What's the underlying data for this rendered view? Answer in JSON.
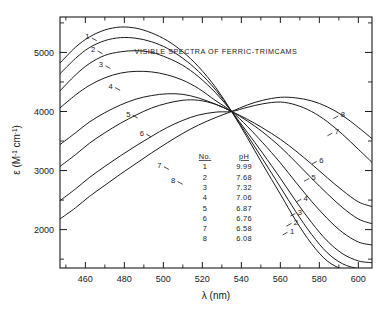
{
  "chart_data": {
    "type": "line",
    "title": "VISIBLE SPECTRA OF FERRIC-TRIMCAMS",
    "xlabel": "λ (nm)",
    "ylabel": "ε (M⁻¹ cm⁻¹)",
    "xlim": [
      447,
      607
    ],
    "ylim": [
      1350,
      5600
    ],
    "xticks": [
      460,
      480,
      500,
      520,
      540,
      560,
      580,
      600
    ],
    "yticks": [
      2000,
      3000,
      4000,
      5000
    ],
    "yminorticks": [
      1500,
      2500,
      3500,
      4500,
      5500
    ],
    "grid": false,
    "legend_position": "center",
    "isosbestic_point": {
      "x": 535,
      "y": 4000
    },
    "legend_headers": [
      "No.",
      "pH"
    ],
    "series": [
      {
        "name": "1",
        "pH": "9.99",
        "peak_x": 478,
        "peak_y": 5430,
        "x": [
          447,
          455,
          462,
          470,
          478,
          486,
          494,
          502,
          510,
          518,
          527,
          535,
          543,
          551,
          560,
          568,
          576,
          584,
          592,
          600,
          607
        ],
        "y": [
          4820,
          5090,
          5260,
          5380,
          5430,
          5410,
          5330,
          5200,
          5010,
          4760,
          4400,
          4000,
          3560,
          3100,
          2600,
          2150,
          1760,
          1470,
          1330,
          1300,
          1300
        ]
      },
      {
        "name": "2",
        "pH": "7.68",
        "peak_x": 480,
        "peak_y": 5250,
        "x": [
          447,
          455,
          462,
          470,
          478,
          486,
          494,
          502,
          510,
          518,
          527,
          535,
          543,
          551,
          560,
          568,
          576,
          584,
          592,
          600,
          607
        ],
        "y": [
          4640,
          4900,
          5080,
          5200,
          5250,
          5240,
          5180,
          5070,
          4900,
          4680,
          4360,
          4000,
          3600,
          3190,
          2720,
          2300,
          1920,
          1610,
          1420,
          1340,
          1330
        ]
      },
      {
        "name": "3",
        "pH": "7.32",
        "peak_x": 482,
        "peak_y": 5030,
        "x": [
          447,
          455,
          462,
          470,
          478,
          486,
          494,
          502,
          510,
          518,
          527,
          535,
          543,
          551,
          560,
          568,
          576,
          584,
          592,
          600,
          607
        ],
        "y": [
          4350,
          4620,
          4810,
          4950,
          5010,
          5030,
          5000,
          4910,
          4780,
          4590,
          4310,
          4000,
          3650,
          3290,
          2870,
          2480,
          2120,
          1810,
          1590,
          1470,
          1440
        ]
      },
      {
        "name": "4",
        "pH": "7.06",
        "peak_x": 484,
        "peak_y": 4680,
        "x": [
          447,
          455,
          462,
          470,
          478,
          486,
          494,
          502,
          510,
          518,
          527,
          535,
          543,
          551,
          560,
          568,
          576,
          584,
          592,
          600,
          607
        ],
        "y": [
          4060,
          4280,
          4440,
          4570,
          4650,
          4680,
          4670,
          4620,
          4530,
          4390,
          4180,
          4000,
          3750,
          3470,
          3130,
          2800,
          2480,
          2190,
          1950,
          1790,
          1740
        ]
      },
      {
        "name": "5",
        "pH": "6.87",
        "peak_x": 490,
        "peak_y": 4300,
        "x": [
          447,
          455,
          462,
          470,
          478,
          486,
          494,
          502,
          510,
          518,
          527,
          535,
          543,
          551,
          560,
          568,
          576,
          584,
          592,
          600,
          607
        ],
        "y": [
          3440,
          3640,
          3820,
          3980,
          4110,
          4210,
          4270,
          4300,
          4290,
          4230,
          4120,
          4000,
          3840,
          3650,
          3400,
          3140,
          2870,
          2610,
          2370,
          2180,
          2100
        ]
      },
      {
        "name": "6",
        "pH": "6.76",
        "peak_x": 498,
        "peak_y": 4190,
        "x": [
          447,
          455,
          462,
          470,
          478,
          486,
          494,
          502,
          510,
          518,
          527,
          535,
          543,
          551,
          560,
          568,
          576,
          584,
          592,
          600,
          607
        ],
        "y": [
          3070,
          3270,
          3460,
          3640,
          3800,
          3940,
          4060,
          4140,
          4190,
          4190,
          4120,
          4000,
          3870,
          3720,
          3530,
          3330,
          3110,
          2880,
          2660,
          2470,
          2390
        ]
      },
      {
        "name": "7",
        "pH": "6.58",
        "peak_x": 553,
        "peak_y": 4180,
        "x": [
          447,
          455,
          462,
          470,
          478,
          486,
          494,
          502,
          510,
          518,
          527,
          535,
          543,
          551,
          560,
          568,
          576,
          584,
          592,
          600,
          607
        ],
        "y": [
          2490,
          2690,
          2880,
          3070,
          3250,
          3420,
          3580,
          3730,
          3850,
          3940,
          3990,
          4000,
          4070,
          4130,
          4160,
          4110,
          4000,
          3830,
          3610,
          3360,
          3140
        ]
      },
      {
        "name": "8",
        "pH": "6.08",
        "peak_x": 560,
        "peak_y": 4240,
        "x": [
          447,
          455,
          462,
          470,
          478,
          486,
          494,
          502,
          510,
          518,
          527,
          535,
          543,
          551,
          560,
          568,
          576,
          584,
          592,
          600,
          607
        ],
        "y": [
          2180,
          2370,
          2560,
          2750,
          2940,
          3120,
          3300,
          3470,
          3630,
          3770,
          3900,
          4000,
          4110,
          4190,
          4240,
          4230,
          4180,
          4080,
          3930,
          3730,
          3540
        ]
      }
    ],
    "left_labels": [
      {
        "name": "1",
        "x": 461,
        "y": 5270
      },
      {
        "name": "2",
        "x": 464,
        "y": 5050
      },
      {
        "name": "3",
        "x": 468,
        "y": 4800
      },
      {
        "name": "4",
        "x": 473,
        "y": 4430
      },
      {
        "name": "5",
        "x": 482,
        "y": 3960
      },
      {
        "name": "6",
        "x": 489,
        "y": 3640
      },
      {
        "name": "7",
        "x": 498,
        "y": 3090
      },
      {
        "name": "8",
        "x": 505,
        "y": 2840
      }
    ],
    "right_labels": [
      {
        "name": "8",
        "x": 592,
        "y": 3950
      },
      {
        "name": "7",
        "x": 589,
        "y": 3660
      },
      {
        "name": "6",
        "x": 581,
        "y": 3180
      },
      {
        "name": "5",
        "x": 577,
        "y": 2890
      },
      {
        "name": "4",
        "x": 573,
        "y": 2540
      },
      {
        "name": "3",
        "x": 570,
        "y": 2300
      },
      {
        "name": "2",
        "x": 568,
        "y": 2130
      },
      {
        "name": "1",
        "x": 566,
        "y": 1980
      }
    ]
  }
}
